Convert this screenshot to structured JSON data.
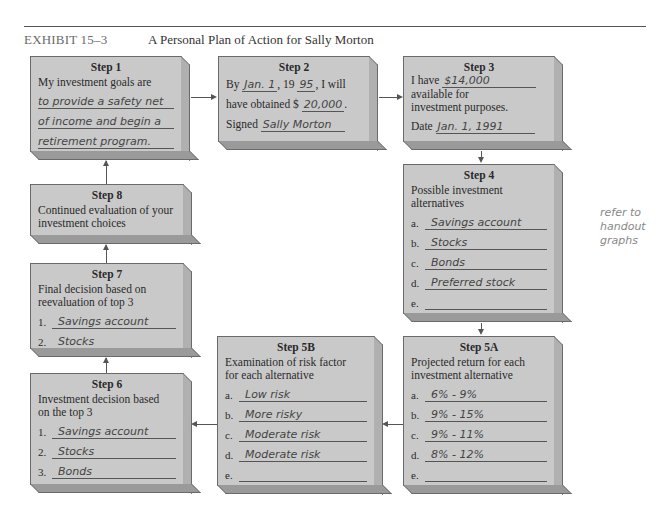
{
  "header": {
    "exhibit_label": "EXHIBIT 15–3",
    "title": "A Personal Plan of Action for Sally Morton"
  },
  "steps": {
    "step1": {
      "title": "Step 1",
      "prompt": "My investment goals are",
      "lines": [
        "to provide a safety net",
        "of income and begin a",
        "retirement program."
      ]
    },
    "step2": {
      "title": "Step 2",
      "by_label": "By",
      "date_value": "Jan. 1",
      "year_prefix": ", 19",
      "year_value": "95",
      "will_text": ", I will",
      "obtained_label": "have obtained $",
      "amount_value": "20,000",
      "period": ".",
      "signed_label": "Signed",
      "signature": "Sally Morton"
    },
    "step3": {
      "title": "Step 3",
      "have_label": "I have",
      "amount_value": "$14,000",
      "text_line2": "available for",
      "text_line3": "investment purposes.",
      "date_label": "Date",
      "date_value": "Jan. 1, 1991"
    },
    "step4": {
      "title": "Step 4",
      "prompt_line1": "Possible investment",
      "prompt_line2": "alternatives",
      "items": [
        {
          "label": "a.",
          "value": "Savings account"
        },
        {
          "label": "b.",
          "value": "Stocks"
        },
        {
          "label": "c.",
          "value": "Bonds"
        },
        {
          "label": "d.",
          "value": "Preferred stock"
        },
        {
          "label": "e.",
          "value": ""
        }
      ]
    },
    "step5a": {
      "title": "Step 5A",
      "prompt_line1": "Projected return for each",
      "prompt_line2": "investment alternative",
      "items": [
        {
          "label": "a.",
          "value": "6% - 9%"
        },
        {
          "label": "b.",
          "value": "9% - 15%"
        },
        {
          "label": "c.",
          "value": "9% - 11%"
        },
        {
          "label": "d.",
          "value": "8% - 12%"
        },
        {
          "label": "e.",
          "value": ""
        }
      ]
    },
    "step5b": {
      "title": "Step 5B",
      "prompt_line1": "Examination of risk factor",
      "prompt_line2": "for each alternative",
      "items": [
        {
          "label": "a.",
          "value": "Low risk"
        },
        {
          "label": "b.",
          "value": "More risky"
        },
        {
          "label": "c.",
          "value": "Moderate risk"
        },
        {
          "label": "d.",
          "value": "Moderate risk"
        },
        {
          "label": "e.",
          "value": ""
        }
      ]
    },
    "step6": {
      "title": "Step 6",
      "prompt_line1": "Investment decision based",
      "prompt_line2": "on the top 3",
      "items": [
        {
          "label": "1.",
          "value": "Savings account"
        },
        {
          "label": "2.",
          "value": "Stocks"
        },
        {
          "label": "3.",
          "value": "Bonds"
        }
      ]
    },
    "step7": {
      "title": "Step 7",
      "prompt_line1": "Final decision based on",
      "prompt_line2": "reevaluation of top 3",
      "items": [
        {
          "label": "1.",
          "value": "Savings account"
        },
        {
          "label": "2.",
          "value": "Stocks"
        }
      ]
    },
    "step8": {
      "title": "Step 8",
      "prompt_line1": "Continued evaluation of your",
      "prompt_line2": "investment choices"
    }
  },
  "margin_note": [
    "refer to",
    "handout",
    "graphs"
  ],
  "colors": {
    "box_face": "#c9c9c9",
    "box_side": "#b0b0b0",
    "box_bottom": "#9a9a9a",
    "border": "#6a6a6a",
    "arrow": "#555555"
  }
}
